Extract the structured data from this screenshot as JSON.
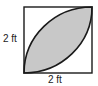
{
  "diagram": {
    "side_left_label": "2 ft",
    "side_bottom_label": "2 ft",
    "colors": {
      "stroke": "#1a1a1a",
      "fill_shaded": "#c8c8c8",
      "background": "#ffffff"
    }
  }
}
